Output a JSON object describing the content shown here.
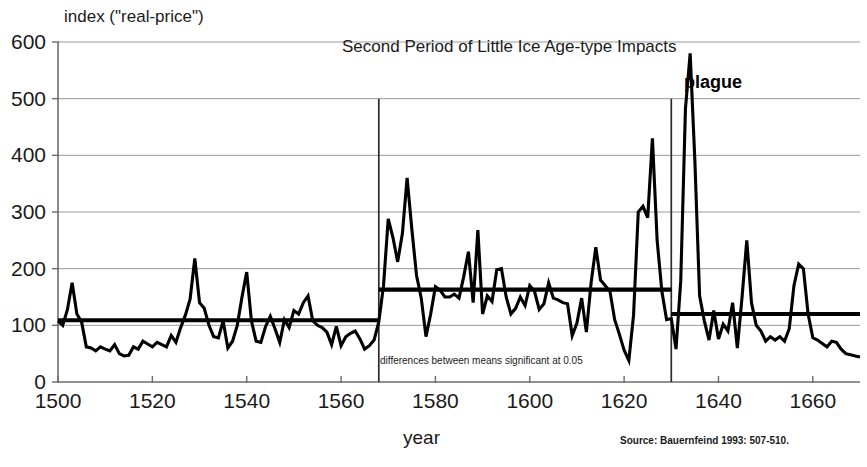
{
  "chart_data": {
    "type": "line",
    "title": "Second Period of Little Ice Age-type Impacts",
    "ylabel": "index (\"real-price\")",
    "xlabel": "year",
    "xlim": [
      1500,
      1670
    ],
    "ylim": [
      0,
      600
    ],
    "xticks": [
      1500,
      1520,
      1540,
      1560,
      1580,
      1600,
      1620,
      1640,
      1660
    ],
    "yticks": [
      0,
      100,
      200,
      300,
      400,
      500,
      600
    ],
    "grid": "horizontal",
    "legend": "none",
    "series": [
      {
        "name": "real-price index",
        "x": [
          1500,
          1501,
          1502,
          1503,
          1504,
          1505,
          1506,
          1507,
          1508,
          1509,
          1510,
          1511,
          1512,
          1513,
          1514,
          1515,
          1516,
          1517,
          1518,
          1519,
          1520,
          1521,
          1522,
          1523,
          1524,
          1525,
          1526,
          1527,
          1528,
          1529,
          1530,
          1531,
          1532,
          1533,
          1534,
          1535,
          1536,
          1537,
          1538,
          1539,
          1540,
          1541,
          1542,
          1543,
          1544,
          1545,
          1546,
          1547,
          1548,
          1549,
          1550,
          1551,
          1552,
          1553,
          1554,
          1555,
          1556,
          1557,
          1558,
          1559,
          1560,
          1561,
          1562,
          1563,
          1564,
          1565,
          1566,
          1567,
          1568,
          1569,
          1570,
          1571,
          1572,
          1573,
          1574,
          1575,
          1576,
          1577,
          1578,
          1579,
          1580,
          1581,
          1582,
          1583,
          1584,
          1585,
          1586,
          1587,
          1588,
          1589,
          1590,
          1591,
          1592,
          1593,
          1594,
          1595,
          1596,
          1597,
          1598,
          1599,
          1600,
          1601,
          1602,
          1603,
          1604,
          1605,
          1606,
          1607,
          1608,
          1609,
          1610,
          1611,
          1612,
          1613,
          1614,
          1615,
          1616,
          1617,
          1618,
          1619,
          1620,
          1621,
          1622,
          1623,
          1624,
          1625,
          1626,
          1627,
          1628,
          1629,
          1630,
          1631,
          1632,
          1633,
          1634,
          1635,
          1636,
          1637,
          1638,
          1639,
          1640,
          1641,
          1642,
          1643,
          1644,
          1645,
          1646,
          1647,
          1648,
          1649,
          1650,
          1651,
          1652,
          1653,
          1654,
          1655,
          1656,
          1657,
          1658,
          1659,
          1660,
          1661,
          1662,
          1663,
          1664,
          1665,
          1666,
          1667,
          1668,
          1669,
          1670
        ],
        "values": [
          108,
          100,
          128,
          175,
          120,
          106,
          62,
          60,
          55,
          62,
          58,
          55,
          66,
          50,
          46,
          47,
          62,
          58,
          72,
          67,
          62,
          70,
          66,
          62,
          82,
          70,
          96,
          118,
          146,
          218,
          140,
          130,
          100,
          80,
          78,
          108,
          60,
          72,
          100,
          150,
          194,
          108,
          72,
          70,
          98,
          116,
          94,
          70,
          110,
          96,
          126,
          120,
          140,
          152,
          108,
          100,
          96,
          88,
          66,
          98,
          64,
          80,
          86,
          90,
          76,
          58,
          64,
          74,
          106,
          170,
          288,
          255,
          212,
          262,
          360,
          270,
          188,
          148,
          80,
          120,
          168,
          162,
          150,
          150,
          155,
          148,
          186,
          230,
          140,
          268,
          120,
          152,
          142,
          198,
          200,
          150,
          120,
          130,
          150,
          135,
          170,
          160,
          128,
          138,
          175,
          148,
          145,
          140,
          138,
          82,
          104,
          148,
          88,
          175,
          238,
          180,
          170,
          160,
          110,
          84,
          56,
          38,
          118,
          300,
          310,
          290,
          430,
          250,
          160,
          110,
          112,
          58,
          178,
          482,
          580,
          390,
          152,
          108,
          74,
          126,
          76,
          102,
          90,
          140,
          60,
          150,
          250,
          140,
          100,
          90,
          72,
          80,
          74,
          80,
          72,
          94,
          170,
          208,
          200,
          120,
          78,
          74,
          68,
          62,
          72,
          70,
          58,
          50,
          48,
          46,
          44
        ]
      }
    ],
    "mean_lines": [
      {
        "label": "mean 1500-1568",
        "x_start": 1500,
        "x_end": 1568,
        "value": 109
      },
      {
        "label": "mean 1568-1630",
        "x_start": 1568,
        "x_end": 1630,
        "value": 163
      },
      {
        "label": "mean 1630-1670",
        "x_start": 1630,
        "x_end": 1670,
        "value": 120
      }
    ],
    "period_markers": [
      {
        "label": "Second Period of Little Ice Age-type Impacts start",
        "x": 1568,
        "y_top": 500
      },
      {
        "label": "Second Period of Little Ice Age-type Impacts end",
        "x": 1630,
        "y_top": 500
      }
    ],
    "annotations": [
      {
        "name": "plague-annotation",
        "text": "plague",
        "x": 1638,
        "y": 520
      },
      {
        "name": "significance-note",
        "text": "differences between means significant at 0.05",
        "x": 1571,
        "y": 38
      }
    ]
  },
  "labels": {
    "y_axis_title": "index (\"real-price\")",
    "x_axis_title": "year",
    "period_title": "Second Period of Little Ice Age-type Impacts",
    "plague": "plague",
    "significance_note": "differences between means significant at 0.05",
    "source": "Source: Bauernfeind 1993: 507-510.",
    "y_ticks": [
      "600",
      "500",
      "400",
      "300",
      "200",
      "100",
      "0"
    ],
    "x_ticks": [
      "1500",
      "1520",
      "1540",
      "1560",
      "1580",
      "1600",
      "1620",
      "1640",
      "1660"
    ]
  },
  "colors": {
    "series": "#000000",
    "grid": "#9a9a9a",
    "axis": "#6d6d6d",
    "text": "#1a1a1a",
    "background": "#ffffff"
  }
}
